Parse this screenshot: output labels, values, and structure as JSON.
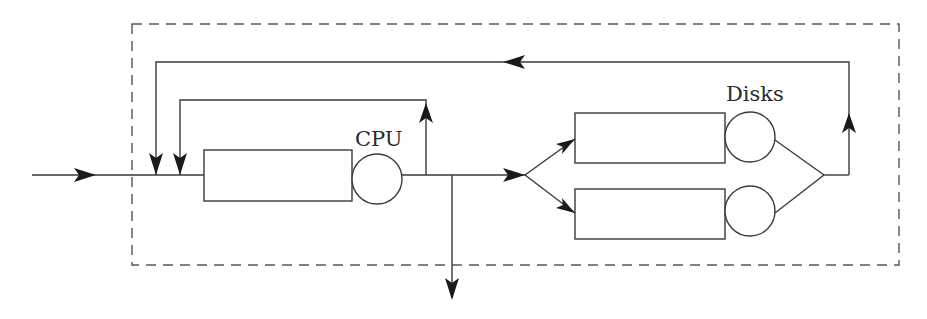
{
  "diagram": {
    "type": "queueing-network",
    "labels": {
      "cpu": "CPU",
      "disks": "Disks"
    },
    "nodes": [
      {
        "id": "cpu",
        "label": "CPU",
        "kind": "queue-server"
      },
      {
        "id": "disk1",
        "label": "Disks",
        "kind": "queue-server"
      },
      {
        "id": "disk2",
        "label": "Disks",
        "kind": "queue-server"
      }
    ],
    "edges": [
      {
        "from": "external-input",
        "to": "cpu"
      },
      {
        "from": "cpu",
        "to": "cpu",
        "kind": "feedback-loop"
      },
      {
        "from": "cpu",
        "to": "external-output"
      },
      {
        "from": "cpu",
        "to": "disk1"
      },
      {
        "from": "cpu",
        "to": "disk2"
      },
      {
        "from": "disk1",
        "to": "cpu",
        "kind": "feedback-loop"
      },
      {
        "from": "disk2",
        "to": "cpu",
        "kind": "feedback-loop"
      }
    ],
    "colors": {
      "stroke": "#3a3a3a",
      "boundary": "#555555",
      "background": "#ffffff"
    }
  }
}
